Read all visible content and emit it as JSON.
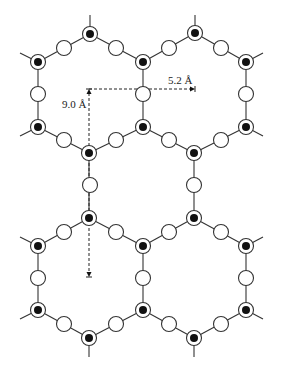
{
  "diagram": {
    "title": "",
    "colors": {
      "line": "#333333",
      "core": "#111111",
      "background": "#ffffff"
    },
    "annotations": {
      "horizontal": {
        "label": "5.2 Å",
        "from": [
          89,
          89
        ],
        "to": [
          195,
          89
        ],
        "label_pos": [
          168,
          84
        ]
      },
      "vertical": {
        "label": "9.0 Å",
        "from": [
          89,
          89
        ],
        "to": [
          89,
          277
        ],
        "label_pos": [
          62,
          108
        ]
      }
    },
    "vertex_atoms": [
      [
        90,
        34
      ],
      [
        38,
        62
      ],
      [
        143,
        62
      ],
      [
        38,
        127
      ],
      [
        143,
        127
      ],
      [
        89,
        153
      ],
      [
        195,
        33
      ],
      [
        246,
        62
      ],
      [
        246,
        127
      ],
      [
        194,
        153
      ],
      [
        89,
        218
      ],
      [
        38,
        246
      ],
      [
        143,
        246
      ],
      [
        38,
        310
      ],
      [
        143,
        310
      ],
      [
        89,
        338
      ],
      [
        194,
        218
      ],
      [
        246,
        246
      ],
      [
        246,
        310
      ],
      [
        194,
        338
      ]
    ],
    "open_atoms": [
      [
        64,
        48
      ],
      [
        116,
        48
      ],
      [
        38,
        94
      ],
      [
        143,
        94
      ],
      [
        64,
        140
      ],
      [
        116,
        140
      ],
      [
        169,
        48
      ],
      [
        221,
        48
      ],
      [
        246,
        94
      ],
      [
        169,
        140
      ],
      [
        221,
        140
      ],
      [
        90,
        185
      ],
      [
        194,
        185
      ],
      [
        64,
        232
      ],
      [
        116,
        232
      ],
      [
        38,
        278
      ],
      [
        143,
        278
      ],
      [
        64,
        324
      ],
      [
        116,
        324
      ],
      [
        169,
        232
      ],
      [
        221,
        232
      ],
      [
        246,
        278
      ],
      [
        169,
        324
      ],
      [
        221,
        324
      ]
    ],
    "bonds": [
      [
        90,
        34,
        38,
        62
      ],
      [
        90,
        34,
        143,
        62
      ],
      [
        38,
        62,
        38,
        127
      ],
      [
        143,
        62,
        143,
        127
      ],
      [
        38,
        127,
        89,
        153
      ],
      [
        143,
        127,
        89,
        153
      ],
      [
        195,
        33,
        143,
        62
      ],
      [
        195,
        33,
        246,
        62
      ],
      [
        246,
        62,
        246,
        127
      ],
      [
        246,
        127,
        194,
        153
      ],
      [
        143,
        127,
        194,
        153
      ],
      [
        89,
        153,
        89,
        218
      ],
      [
        194,
        153,
        194,
        218
      ],
      [
        89,
        218,
        38,
        246
      ],
      [
        89,
        218,
        143,
        246
      ],
      [
        38,
        246,
        38,
        310
      ],
      [
        143,
        246,
        143,
        310
      ],
      [
        38,
        310,
        89,
        338
      ],
      [
        143,
        310,
        89,
        338
      ],
      [
        194,
        218,
        143,
        246
      ],
      [
        194,
        218,
        246,
        246
      ],
      [
        246,
        246,
        246,
        310
      ],
      [
        246,
        310,
        194,
        338
      ],
      [
        143,
        310,
        194,
        338
      ]
    ],
    "stubs": [
      [
        90,
        34,
        90,
        15
      ],
      [
        195,
        33,
        195,
        15
      ],
      [
        38,
        62,
        20,
        53
      ],
      [
        246,
        62,
        263,
        53
      ],
      [
        38,
        127,
        20,
        136
      ],
      [
        246,
        127,
        263,
        136
      ],
      [
        38,
        246,
        20,
        237
      ],
      [
        246,
        246,
        263,
        237
      ],
      [
        38,
        310,
        20,
        319
      ],
      [
        246,
        310,
        263,
        319
      ],
      [
        89,
        338,
        89,
        357
      ],
      [
        194,
        338,
        194,
        357
      ]
    ]
  }
}
